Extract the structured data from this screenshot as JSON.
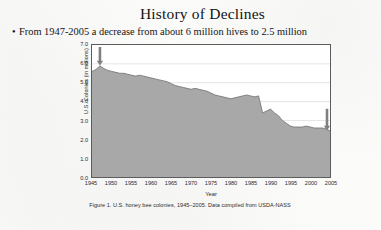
{
  "slide": {
    "title": "History of Declines",
    "bullet_marker": "•",
    "bullet_text": "From 1947-2005 a decrease from about 6 million hives to 2.5 million"
  },
  "figure": {
    "caption": "Figure 1. U.S. honey bee colonies, 1945–2005. Data compiled from USDA-NASS"
  },
  "chart_data": {
    "type": "area",
    "title": "",
    "xlabel": "Year",
    "ylabel": "U.S. Colonies (in millions)",
    "xlim": [
      1945,
      2005
    ],
    "ylim": [
      0.0,
      7.0
    ],
    "grid": true,
    "legend": false,
    "xticks": [
      1945,
      1950,
      1955,
      1960,
      1965,
      1970,
      1975,
      1980,
      1985,
      1990,
      1995,
      2000,
      2005
    ],
    "yticks": [
      "0.0",
      "1.0",
      "2.0",
      "3.0",
      "4.0",
      "5.0",
      "6.0",
      "7.0"
    ],
    "series_name": "U.S. honey bee colonies",
    "fill_color": "#a8a8a8",
    "line_color": "#6e6e6e",
    "x": [
      1945,
      1946,
      1947,
      1948,
      1949,
      1950,
      1951,
      1952,
      1953,
      1954,
      1955,
      1956,
      1957,
      1958,
      1959,
      1960,
      1961,
      1962,
      1963,
      1964,
      1965,
      1966,
      1967,
      1968,
      1969,
      1970,
      1971,
      1972,
      1973,
      1974,
      1975,
      1976,
      1977,
      1978,
      1979,
      1980,
      1981,
      1982,
      1983,
      1984,
      1985,
      1986,
      1987,
      1988,
      1989,
      1990,
      1991,
      1992,
      1993,
      1994,
      1995,
      1996,
      1997,
      1998,
      1999,
      2000,
      2001,
      2002,
      2003,
      2004,
      2005
    ],
    "values": [
      5.6,
      5.7,
      5.9,
      5.75,
      5.65,
      5.6,
      5.55,
      5.5,
      5.5,
      5.45,
      5.4,
      5.35,
      5.4,
      5.35,
      5.3,
      5.25,
      5.2,
      5.15,
      5.1,
      5.05,
      4.95,
      4.85,
      4.8,
      4.75,
      4.7,
      4.65,
      4.7,
      4.65,
      4.6,
      4.55,
      4.45,
      4.35,
      4.3,
      4.25,
      4.2,
      4.15,
      4.2,
      4.25,
      4.3,
      4.35,
      4.3,
      4.25,
      4.3,
      3.4,
      3.5,
      3.6,
      3.4,
      3.25,
      3.0,
      2.85,
      2.7,
      2.65,
      2.65,
      2.65,
      2.7,
      2.65,
      2.6,
      2.6,
      2.6,
      2.55,
      2.45
    ],
    "annotations": [
      {
        "name": "arrow-start",
        "x": 1947,
        "value": 5.9,
        "label": "",
        "glyph": "down-arrow"
      },
      {
        "name": "arrow-end",
        "x": 2005,
        "value": 2.45,
        "label": "",
        "glyph": "down-arrow"
      }
    ]
  }
}
